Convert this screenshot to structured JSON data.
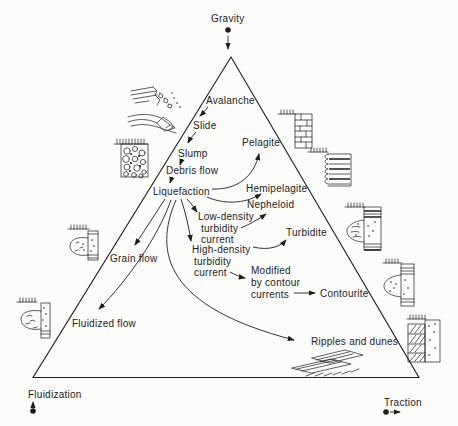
{
  "diagram": {
    "type": "triangular process diagram of sediment transport and deposits",
    "colors": {
      "ink": "#1d1d1d",
      "paper": "#fcfcfa"
    },
    "vertices": {
      "top": {
        "label": "Gravity",
        "marker": "dot-with-down-arrow"
      },
      "bottom_left": {
        "label": "Fluidization",
        "marker": "dot-with-dashed-up-arrow"
      },
      "bottom_right": {
        "label": "Traction",
        "marker": "dot-with-right-arrow"
      }
    },
    "labels": {
      "gravity": "Gravity",
      "fluidization": "Fluidization",
      "traction": "Traction",
      "avalanche": "Avalanche",
      "slide": "Slide",
      "slump": "Slump",
      "debris_flow": "Debris flow",
      "liquefaction": "Liquefaction",
      "pelagite": "Pelagite",
      "hemipelagite": "Hemipelagite",
      "nepheloid": "Nepheloid",
      "low_density": {
        "l1": "Low-density",
        "l2": "turbidity",
        "l3": "current"
      },
      "high_density": {
        "l1": "High-density",
        "l2": "turbidity",
        "l3": "current"
      },
      "turbidite": "Turbidite",
      "modified": {
        "l1": "Modified",
        "l2": "by contour",
        "l3": "currents"
      },
      "contourite": "Contourite",
      "grain_flow": "Grain flow",
      "fluidized_flow": "Fluidized flow",
      "ripples_and_dunes": "Ripples and dunes"
    },
    "relations": [
      {
        "from": "Gravity",
        "to": "triangle apex"
      },
      {
        "from": "Avalanche",
        "to": "Slide"
      },
      {
        "from": "Slide",
        "to": "Slump"
      },
      {
        "from": "Slump",
        "to": "Debris flow"
      },
      {
        "from": "Debris flow",
        "to": "Liquefaction"
      },
      {
        "from": "Liquefaction",
        "to": "Pelagite"
      },
      {
        "from": "Liquefaction",
        "to": "Hemipelagite"
      },
      {
        "from": "Liquefaction",
        "to": "Low-density turbidity current"
      },
      {
        "from": "Liquefaction",
        "to": "High-density turbidity current"
      },
      {
        "from": "Liquefaction",
        "to": "Grain flow"
      },
      {
        "from": "Liquefaction",
        "to": "Fluidized flow"
      },
      {
        "from": "Liquefaction",
        "to": "Ripples and dunes"
      },
      {
        "from": "Low-density turbidity current",
        "to": "Nepheloid"
      },
      {
        "from": "High-density turbidity current",
        "to": "Turbidite"
      },
      {
        "from": "High-density turbidity current",
        "to": "Modified by contour currents"
      },
      {
        "from": "Modified by contour currents",
        "to": "Contourite"
      }
    ],
    "icons": [
      "avalanche-sketch",
      "slide-sketch",
      "slump-breccia-sketch",
      "grain-flow-log",
      "fluidized-flow-log",
      "pelagite-log",
      "hemipelagite-log",
      "turbidite-log",
      "contourite-log",
      "traction-log",
      "ripples-sketch"
    ]
  }
}
